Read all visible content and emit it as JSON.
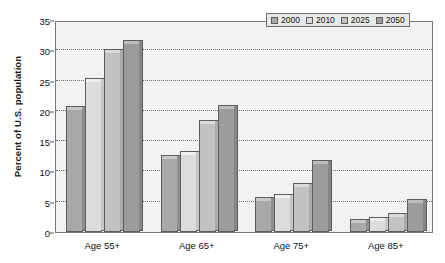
{
  "chart_data": {
    "type": "bar",
    "title": "",
    "subtitle": "",
    "xlabel": "",
    "ylabel": "Percent of U.S. population",
    "ylim": [
      0,
      35
    ],
    "ytick_step": 5,
    "yticks": [
      "0",
      "5",
      "10",
      "15",
      "20",
      "25",
      "30",
      "35"
    ],
    "grid": true,
    "grid_axis": "y",
    "legend_position": "top-right",
    "categories": [
      "Age 55+",
      "Age 65+",
      "Age 75+",
      "Age 85+"
    ],
    "series": [
      {
        "name": "2000",
        "color": "#a8a8a8",
        "values": [
          20.3,
          12.2,
          5.3,
          1.6
        ]
      },
      {
        "name": "2010",
        "color": "#dcdcdc",
        "values": [
          25.0,
          12.9,
          5.8,
          2.0
        ]
      },
      {
        "name": "2025",
        "color": "#c2c2c2",
        "values": [
          29.8,
          18.0,
          7.6,
          2.6
        ]
      },
      {
        "name": "2050",
        "color": "#9c9c9c",
        "values": [
          31.2,
          20.5,
          11.4,
          5.0
        ]
      }
    ]
  },
  "legend": {
    "items": [
      {
        "label": "2000"
      },
      {
        "label": "2010"
      },
      {
        "label": "2025"
      },
      {
        "label": "2050"
      }
    ]
  },
  "axes": {
    "y_title": "Percent of U.S. population"
  },
  "colors": {
    "plot_background": "#f2f2f0",
    "page_background": "#ffffff",
    "axis_line": "#777777",
    "gridline": "#6e6e6e",
    "text": "#111111"
  }
}
